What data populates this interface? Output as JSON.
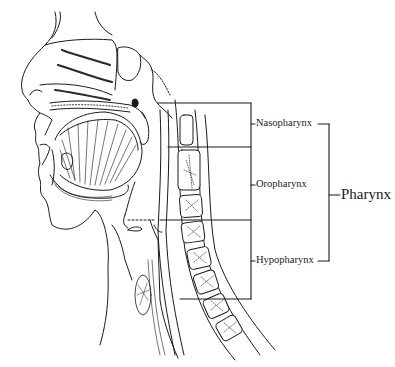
{
  "diagram": {
    "type": "anatomical sagittal section of head and neck",
    "labels": {
      "nasopharynx": "Nasopharynx",
      "oropharynx": "Oropharynx",
      "hypopharynx": "Hypopharynx",
      "pharynx": "Pharynx"
    },
    "colors": {
      "line": "#1a1a1a",
      "background": "#ffffff",
      "stipple": "#333333"
    }
  }
}
